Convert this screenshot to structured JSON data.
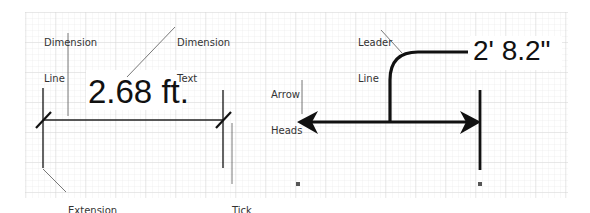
{
  "diagram": {
    "title": "",
    "background": "#ffffff",
    "grid": {
      "color": "#d8d8d8",
      "minor_spacing_px": 6,
      "area": [
        25,
        12,
        568,
        198
      ]
    },
    "left_example": {
      "dimension_value": "2.68 ft.",
      "annotations": {
        "dimension_line": [
          "Dimension",
          "Line"
        ],
        "dimension_text": [
          "Dimension",
          "Text"
        ],
        "extension_line": [
          "Extension",
          "Line"
        ],
        "tick_marks": [
          "Tick",
          "Marks"
        ]
      }
    },
    "right_example": {
      "dimension_value": "2' 8.2\"",
      "annotations": {
        "leader_line": [
          "Leader",
          "Line"
        ],
        "arrow_heads": [
          "Arrow",
          "Heads"
        ]
      }
    },
    "colors": {
      "line": "#111111",
      "pointer": "#555555",
      "label": "#333333"
    }
  }
}
